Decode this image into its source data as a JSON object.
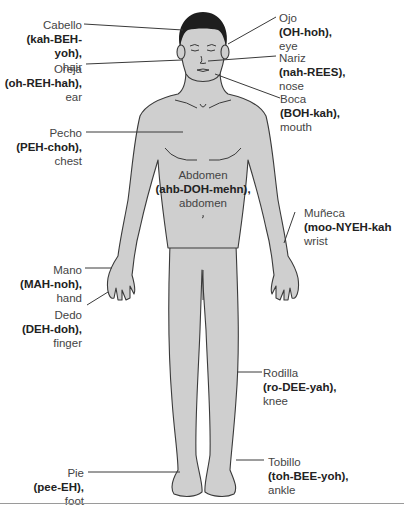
{
  "figure": {
    "body_fill": "#cfcfcf",
    "hair_color": "#1e1e1e",
    "line_color": "#3a3a3a"
  },
  "labels": [
    {
      "id": "cabello",
      "term": "Cabello",
      "pron": "(kah-BEH-yoh),",
      "english": "hair"
    },
    {
      "id": "oreja",
      "term": "Oreja",
      "pron": "(oh-REH-hah),",
      "english": "ear"
    },
    {
      "id": "pecho",
      "term": "Pecho",
      "pron": "(PEH-choh),",
      "english": "chest"
    },
    {
      "id": "ojo",
      "term": "Ojo",
      "pron": "(OH-hoh),",
      "english": "eye"
    },
    {
      "id": "nariz",
      "term": "Nariz",
      "pron": "(nah-REES),",
      "english": "nose"
    },
    {
      "id": "boca",
      "term": "Boca",
      "pron": "(BOH-kah),",
      "english": "mouth"
    },
    {
      "id": "abdomen",
      "term": "Abdomen",
      "pron": "(ahb-DOH-mehn),",
      "english": "abdomen"
    },
    {
      "id": "muneca",
      "term": "Muñeca",
      "pron": "(moo-NYEH-kah",
      "english": "wrist"
    },
    {
      "id": "mano",
      "term": "Mano",
      "pron": "(MAH-noh),",
      "english": "hand"
    },
    {
      "id": "dedo",
      "term": "Dedo",
      "pron": "(DEH-doh),",
      "english": "finger"
    },
    {
      "id": "rodilla",
      "term": "Rodilla",
      "pron": "(ro-DEE-yah),",
      "english": "knee"
    },
    {
      "id": "pie",
      "term": "Pie",
      "pron": "(pee-EH),",
      "english": "foot"
    },
    {
      "id": "tobillo",
      "term": "Tobillo",
      "pron": "(toh-BEE-yoh),",
      "english": "ankle"
    }
  ]
}
